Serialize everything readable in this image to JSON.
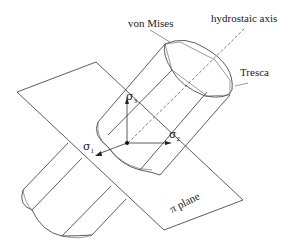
{
  "diagram": {
    "labels": {
      "von_mises": "von Mises",
      "hydrostatic_axis": "hydrostaic axis",
      "tresca": "Tresca",
      "pi_plane": "π plane"
    },
    "axes": [
      {
        "symbol": "σ",
        "subscript": "1"
      },
      {
        "symbol": "σ",
        "subscript": "2"
      },
      {
        "symbol": "σ",
        "subscript": "3"
      }
    ],
    "colors": {
      "line": "#333333",
      "background": "#ffffff"
    }
  }
}
